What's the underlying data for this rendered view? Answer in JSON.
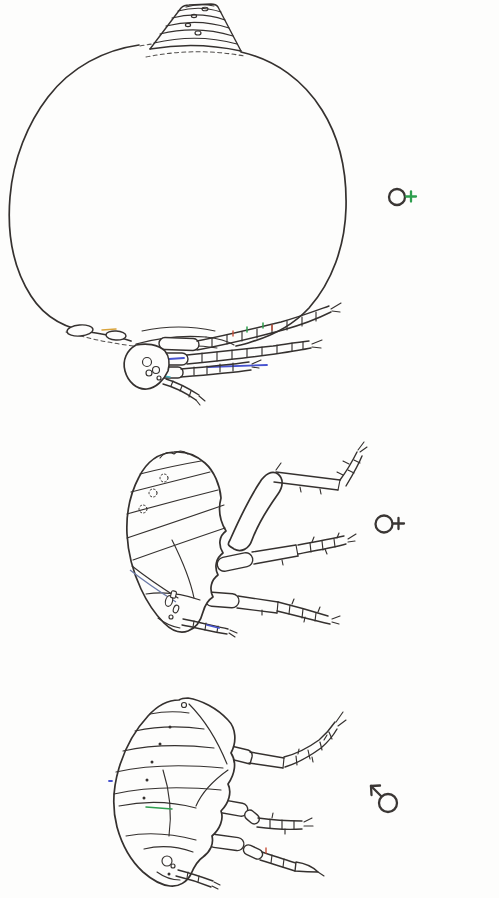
{
  "page": {
    "background": "#fdfdfc",
    "width": 499,
    "height": 898
  },
  "css_vars": {
    "ink": "#35312f",
    "paper": "#fdfdfc",
    "blue": "#4753cf",
    "green": "#2e9e4e",
    "red": "#c7503b",
    "orange": "#d9a43c",
    "cyan": "#3fb3c0",
    "band": "#6b7aa8"
  },
  "figures": [
    {
      "sex": "female",
      "symbol": "circle-with-cross-right",
      "ring_color": "#3a3634",
      "cross_color": "#2e9e4e"
    },
    {
      "sex": "female",
      "symbol": "circle-with-cross-right",
      "ring_color": "#3a3634",
      "cross_color": "#3a3634"
    },
    {
      "sex": "male",
      "symbol": "circle-with-arrow-upper-left",
      "ring_color": "#3a3634",
      "arrow_color": "#3a3634"
    }
  ],
  "artwork": {
    "line_color": "#35312f",
    "artifact_colors": {
      "blue": "#4753cf",
      "green": "#2e9e4e",
      "red": "#c7503b",
      "orange": "#d9a43c",
      "cyan": "#3fb3c0"
    }
  }
}
